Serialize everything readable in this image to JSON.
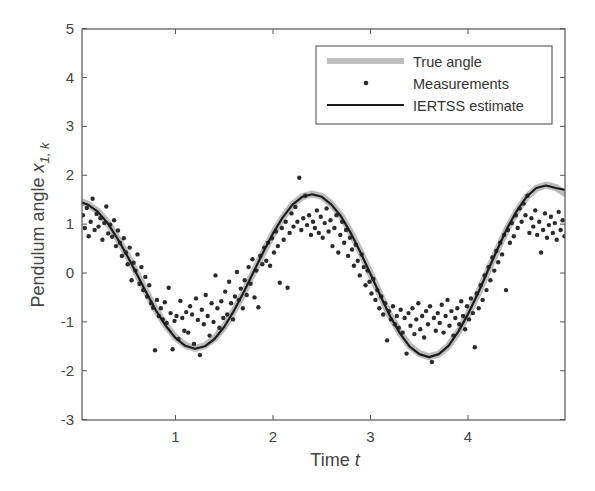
{
  "chart_data": {
    "type": "line",
    "title": "",
    "xlabel": "Time",
    "xlabel_italic": "t",
    "ylabel": "Pendulum angle",
    "ylabel_symbol": "x",
    "ylabel_subscript": "1, k",
    "xlim": [
      0.04,
      5.0
    ],
    "ylim": [
      -3,
      5
    ],
    "xticks": [
      1,
      2,
      3,
      4
    ],
    "xtick_labels": [
      "1",
      "2",
      "3",
      "4"
    ],
    "yticks": [
      -3,
      -2,
      -1,
      0,
      1,
      2,
      3,
      4,
      5
    ],
    "ytick_labels": [
      "-3",
      "-2",
      "-1",
      "0",
      "1",
      "2",
      "3",
      "4",
      "5"
    ],
    "grid": false,
    "legend_position": "upper right",
    "legend": [
      {
        "label": "True angle",
        "style": "thick-gray-line",
        "color": "#b8b8b8"
      },
      {
        "label": "Measurements",
        "style": "dot",
        "color": "#2a2a2a"
      },
      {
        "label": "IERTSS estimate",
        "style": "solid-line",
        "color": "#1e1e1e"
      }
    ],
    "series": [
      {
        "name": "True angle",
        "x": [
          0.04,
          0.1,
          0.2,
          0.3,
          0.4,
          0.5,
          0.6,
          0.7,
          0.8,
          0.9,
          1.0,
          1.1,
          1.2,
          1.3,
          1.4,
          1.5,
          1.6,
          1.7,
          1.8,
          1.9,
          2.0,
          2.1,
          2.2,
          2.3,
          2.4,
          2.5,
          2.6,
          2.7,
          2.8,
          2.9,
          3.0,
          3.1,
          3.2,
          3.3,
          3.4,
          3.5,
          3.6,
          3.7,
          3.8,
          3.9,
          4.0,
          4.1,
          4.2,
          4.3,
          4.4,
          4.5,
          4.6,
          4.7,
          4.8,
          4.9,
          5.0
        ],
        "y": [
          1.45,
          1.41,
          1.27,
          1.04,
          0.73,
          0.38,
          0.0,
          -0.39,
          -0.76,
          -1.07,
          -1.32,
          -1.48,
          -1.54,
          -1.49,
          -1.34,
          -1.1,
          -0.77,
          -0.4,
          0.01,
          0.42,
          0.8,
          1.13,
          1.4,
          1.56,
          1.62,
          1.57,
          1.41,
          1.16,
          0.82,
          0.42,
          -0.01,
          -0.45,
          -0.87,
          -1.22,
          -1.49,
          -1.65,
          -1.71,
          -1.66,
          -1.49,
          -1.21,
          -0.85,
          -0.44,
          0.02,
          0.47,
          0.9,
          1.26,
          1.55,
          1.73,
          1.8,
          1.75,
          1.62
        ]
      },
      {
        "name": "IERTSS estimate",
        "x": [
          0.04,
          0.1,
          0.2,
          0.3,
          0.4,
          0.5,
          0.6,
          0.7,
          0.8,
          0.9,
          1.0,
          1.1,
          1.2,
          1.3,
          1.4,
          1.5,
          1.6,
          1.7,
          1.8,
          1.9,
          2.0,
          2.1,
          2.2,
          2.3,
          2.4,
          2.5,
          2.6,
          2.7,
          2.8,
          2.9,
          3.0,
          3.1,
          3.2,
          3.3,
          3.4,
          3.5,
          3.6,
          3.7,
          3.8,
          3.9,
          4.0,
          4.1,
          4.2,
          4.3,
          4.4,
          4.5,
          4.6,
          4.7,
          4.8,
          4.9,
          5.0
        ],
        "y": [
          1.44,
          1.4,
          1.26,
          1.03,
          0.72,
          0.37,
          -0.01,
          -0.4,
          -0.77,
          -1.08,
          -1.33,
          -1.49,
          -1.55,
          -1.5,
          -1.35,
          -1.1,
          -0.77,
          -0.39,
          0.02,
          0.43,
          0.81,
          1.14,
          1.4,
          1.56,
          1.61,
          1.56,
          1.4,
          1.15,
          0.81,
          0.41,
          -0.02,
          -0.46,
          -0.88,
          -1.23,
          -1.5,
          -1.66,
          -1.72,
          -1.66,
          -1.49,
          -1.2,
          -0.84,
          -0.43,
          0.03,
          0.48,
          0.91,
          1.27,
          1.56,
          1.74,
          1.79,
          1.74,
          1.7
        ]
      },
      {
        "name": "Measurements",
        "points": [
          [
            0.05,
            1.18
          ],
          [
            0.07,
            0.92
          ],
          [
            0.09,
            1.33
          ],
          [
            0.11,
            0.75
          ],
          [
            0.13,
            1.05
          ],
          [
            0.15,
            1.52
          ],
          [
            0.17,
            0.88
          ],
          [
            0.19,
            1.21
          ],
          [
            0.21,
            0.95
          ],
          [
            0.23,
            1.12
          ],
          [
            0.25,
            0.68
          ],
          [
            0.27,
            1.02
          ],
          [
            0.29,
            1.36
          ],
          [
            0.31,
            0.81
          ],
          [
            0.33,
            0.99
          ],
          [
            0.35,
            0.74
          ],
          [
            0.37,
            1.08
          ],
          [
            0.39,
            0.55
          ],
          [
            0.41,
            0.87
          ],
          [
            0.43,
            0.62
          ],
          [
            0.45,
            0.35
          ],
          [
            0.47,
            0.71
          ],
          [
            0.49,
            0.42
          ],
          [
            0.51,
            0.18
          ],
          [
            0.53,
            0.52
          ],
          [
            0.55,
            -0.15
          ],
          [
            0.57,
            0.21
          ],
          [
            0.59,
            0.05
          ],
          [
            0.61,
            0.38
          ],
          [
            0.63,
            -0.22
          ],
          [
            0.65,
            0.12
          ],
          [
            0.67,
            -0.35
          ],
          [
            0.69,
            -0.08
          ],
          [
            0.71,
            -0.48
          ],
          [
            0.73,
            -0.25
          ],
          [
            0.75,
            -0.62
          ],
          [
            0.77,
            -0.71
          ],
          [
            0.79,
            -1.58
          ],
          [
            0.81,
            -0.55
          ],
          [
            0.83,
            -0.88
          ],
          [
            0.85,
            -0.72
          ],
          [
            0.87,
            -0.95
          ],
          [
            0.89,
            -0.6
          ],
          [
            0.91,
            -1.02
          ],
          [
            0.93,
            -0.3
          ],
          [
            0.95,
            -0.82
          ],
          [
            0.97,
            -1.56
          ],
          [
            0.99,
            -0.98
          ],
          [
            1.01,
            -0.88
          ],
          [
            1.03,
            -1.35
          ],
          [
            1.05,
            -0.57
          ],
          [
            1.07,
            -0.92
          ],
          [
            1.09,
            -1.18
          ],
          [
            1.11,
            -0.8
          ],
          [
            1.13,
            -1.22
          ],
          [
            1.15,
            -0.68
          ],
          [
            1.17,
            -0.85
          ],
          [
            1.19,
            -1.45
          ],
          [
            1.21,
            -0.52
          ],
          [
            1.23,
            -0.96
          ],
          [
            1.25,
            -1.68
          ],
          [
            1.27,
            -0.75
          ],
          [
            1.29,
            -1.05
          ],
          [
            1.31,
            -0.45
          ],
          [
            1.33,
            -0.88
          ],
          [
            1.35,
            -1.28
          ],
          [
            1.37,
            -0.62
          ],
          [
            1.39,
            -1.0
          ],
          [
            1.41,
            -0.05
          ],
          [
            1.43,
            -0.72
          ],
          [
            1.45,
            -1.12
          ],
          [
            1.47,
            -0.58
          ],
          [
            1.49,
            -0.92
          ],
          [
            1.51,
            -0.38
          ],
          [
            1.53,
            -0.85
          ],
          [
            1.55,
            -0.18
          ],
          [
            1.57,
            -0.62
          ],
          [
            1.59,
            -0.95
          ],
          [
            1.61,
            -0.48
          ],
          [
            1.63,
            0.02
          ],
          [
            1.65,
            -0.55
          ],
          [
            1.67,
            -0.32
          ],
          [
            1.69,
            -0.72
          ],
          [
            1.71,
            -0.15
          ],
          [
            1.73,
            -0.45
          ],
          [
            1.75,
            0.12
          ],
          [
            1.77,
            -0.22
          ],
          [
            1.79,
            0.28
          ],
          [
            1.81,
            -0.5
          ],
          [
            1.83,
            0.05
          ],
          [
            1.85,
            -0.7
          ],
          [
            1.87,
            0.35
          ],
          [
            1.89,
            0.18
          ],
          [
            1.91,
            0.52
          ],
          [
            1.93,
            0.25
          ],
          [
            1.95,
            0.62
          ],
          [
            1.97,
            0.15
          ],
          [
            1.99,
            0.71
          ],
          [
            2.01,
            0.42
          ],
          [
            2.03,
            0.85
          ],
          [
            2.05,
            0.55
          ],
          [
            2.07,
            -0.2
          ],
          [
            2.09,
            0.92
          ],
          [
            2.11,
            0.68
          ],
          [
            2.13,
            1.05
          ],
          [
            2.15,
            -0.3
          ],
          [
            2.17,
            0.82
          ],
          [
            2.19,
            1.22
          ],
          [
            2.21,
            0.95
          ],
          [
            2.23,
            1.35
          ],
          [
            2.25,
            1.05
          ],
          [
            2.27,
            1.95
          ],
          [
            2.29,
            0.88
          ],
          [
            2.31,
            1.12
          ],
          [
            2.33,
            1.58
          ],
          [
            2.35,
            0.98
          ],
          [
            2.37,
            1.18
          ],
          [
            2.39,
            0.78
          ],
          [
            2.41,
            1.05
          ],
          [
            2.43,
            0.92
          ],
          [
            2.45,
            1.28
          ],
          [
            2.47,
            0.82
          ],
          [
            2.49,
            1.15
          ],
          [
            2.51,
            0.72
          ],
          [
            2.53,
            1.02
          ],
          [
            2.55,
            1.32
          ],
          [
            2.57,
            0.85
          ],
          [
            2.59,
            1.08
          ],
          [
            2.61,
            0.55
          ],
          [
            2.63,
            0.92
          ],
          [
            2.65,
            1.18
          ],
          [
            2.67,
            0.42
          ],
          [
            2.69,
            0.78
          ],
          [
            2.71,
            1.05
          ],
          [
            2.73,
            0.62
          ],
          [
            2.75,
            0.88
          ],
          [
            2.77,
            0.35
          ],
          [
            2.79,
            0.72
          ],
          [
            2.81,
            0.48
          ],
          [
            2.83,
            0.15
          ],
          [
            2.85,
            0.58
          ],
          [
            2.87,
            0.25
          ],
          [
            2.89,
            -0.05
          ],
          [
            2.91,
            0.38
          ],
          [
            2.93,
            0.12
          ],
          [
            2.95,
            -0.25
          ],
          [
            2.97,
            0.05
          ],
          [
            2.99,
            -0.18
          ],
          [
            3.01,
            -0.42
          ],
          [
            3.03,
            -0.12
          ],
          [
            3.05,
            -0.55
          ],
          [
            3.07,
            -0.35
          ],
          [
            3.09,
            -0.72
          ],
          [
            3.11,
            -0.48
          ],
          [
            3.13,
            -0.85
          ],
          [
            3.15,
            -0.62
          ],
          [
            3.17,
            -1.38
          ],
          [
            3.19,
            -0.78
          ],
          [
            3.21,
            -0.95
          ],
          [
            3.23,
            -0.68
          ],
          [
            3.25,
            -1.05
          ],
          [
            3.27,
            -0.88
          ],
          [
            3.29,
            -1.12
          ],
          [
            3.31,
            -0.75
          ],
          [
            3.33,
            -1.22
          ],
          [
            3.35,
            -0.92
          ],
          [
            3.37,
            -1.65
          ],
          [
            3.39,
            -0.82
          ],
          [
            3.41,
            -1.08
          ],
          [
            3.43,
            -0.72
          ],
          [
            3.45,
            -1.25
          ],
          [
            3.47,
            -0.95
          ],
          [
            3.49,
            -0.62
          ],
          [
            3.51,
            -1.15
          ],
          [
            3.53,
            -0.88
          ],
          [
            3.55,
            -1.32
          ],
          [
            3.57,
            -0.78
          ],
          [
            3.59,
            -1.05
          ],
          [
            3.61,
            -0.68
          ],
          [
            3.63,
            -1.82
          ],
          [
            3.65,
            -0.92
          ],
          [
            3.67,
            -1.18
          ],
          [
            3.69,
            -0.82
          ],
          [
            3.71,
            -1.02
          ],
          [
            3.73,
            -0.65
          ],
          [
            3.75,
            -1.22
          ],
          [
            3.77,
            -0.88
          ],
          [
            3.79,
            -0.55
          ],
          [
            3.81,
            -1.08
          ],
          [
            3.83,
            -0.78
          ],
          [
            3.85,
            -1.28
          ],
          [
            3.87,
            -0.92
          ],
          [
            3.89,
            -0.72
          ],
          [
            3.91,
            -1.05
          ],
          [
            3.93,
            -0.58
          ],
          [
            3.95,
            -0.88
          ],
          [
            3.97,
            -1.15
          ],
          [
            3.99,
            -0.68
          ],
          [
            4.01,
            -0.95
          ],
          [
            4.03,
            -0.52
          ],
          [
            4.05,
            -0.82
          ],
          [
            4.07,
            -1.52
          ],
          [
            4.09,
            -0.42
          ],
          [
            4.11,
            -0.72
          ],
          [
            4.13,
            -0.25
          ],
          [
            4.15,
            -0.55
          ],
          [
            4.17,
            -0.05
          ],
          [
            4.19,
            -0.35
          ],
          [
            4.21,
            0.12
          ],
          [
            4.23,
            -0.15
          ],
          [
            4.25,
            0.32
          ],
          [
            4.27,
            0.05
          ],
          [
            4.29,
            0.45
          ],
          [
            4.31,
            0.22
          ],
          [
            4.33,
            0.62
          ],
          [
            4.35,
            0.38
          ],
          [
            4.37,
            0.78
          ],
          [
            4.39,
            -0.35
          ],
          [
            4.41,
            0.88
          ],
          [
            4.43,
            0.62
          ],
          [
            4.45,
            1.02
          ],
          [
            4.47,
            0.75
          ],
          [
            4.49,
            1.18
          ],
          [
            4.51,
            0.92
          ],
          [
            4.53,
            1.32
          ],
          [
            4.55,
            1.05
          ],
          [
            4.57,
            1.42
          ],
          [
            4.59,
            1.18
          ],
          [
            4.61,
            1.58
          ],
          [
            4.63,
            0.82
          ],
          [
            4.65,
            1.12
          ],
          [
            4.67,
            0.95
          ],
          [
            4.69,
            1.28
          ],
          [
            4.71,
            0.78
          ],
          [
            4.73,
            1.05
          ],
          [
            4.75,
            0.42
          ],
          [
            4.77,
            0.88
          ],
          [
            4.79,
            1.22
          ],
          [
            4.81,
            0.72
          ],
          [
            4.83,
            0.98
          ],
          [
            4.85,
            1.15
          ],
          [
            4.87,
            0.82
          ],
          [
            4.89,
            1.02
          ],
          [
            4.91,
            0.68
          ],
          [
            4.93,
            1.25
          ],
          [
            4.95,
            0.88
          ],
          [
            4.97,
            1.08
          ],
          [
            4.99,
            0.75
          ]
        ]
      }
    ]
  },
  "plot_area": {
    "left": 82,
    "top": 29,
    "right": 565,
    "bottom": 420
  }
}
